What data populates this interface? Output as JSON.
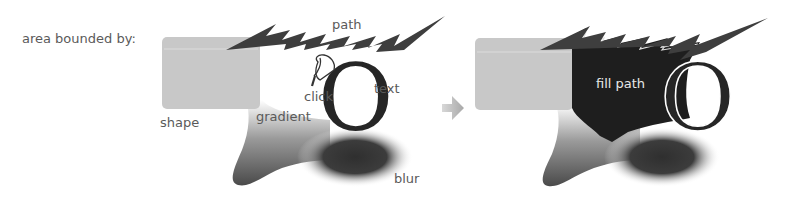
{
  "diagram": {
    "intro_label": "area bounded by:",
    "left_panel": {
      "labels": {
        "path": "path",
        "shape": "shape",
        "click": "click",
        "text": "text",
        "gradient": "gradient",
        "blur": "blur"
      },
      "glyph": "O",
      "icon": "paint-bucket-icon"
    },
    "arrow": "right-arrow-icon",
    "right_panel": {
      "labels": {
        "fill_path": "fill path"
      },
      "glyph": "O"
    },
    "colors": {
      "shape_fill": "#c8c8c8",
      "path_stroke": "#444444",
      "fill_dark": "#1e1e1e",
      "blur": "#3a3a3a",
      "arrow": "#b0b0b0",
      "label": "#5a5a5a"
    }
  }
}
